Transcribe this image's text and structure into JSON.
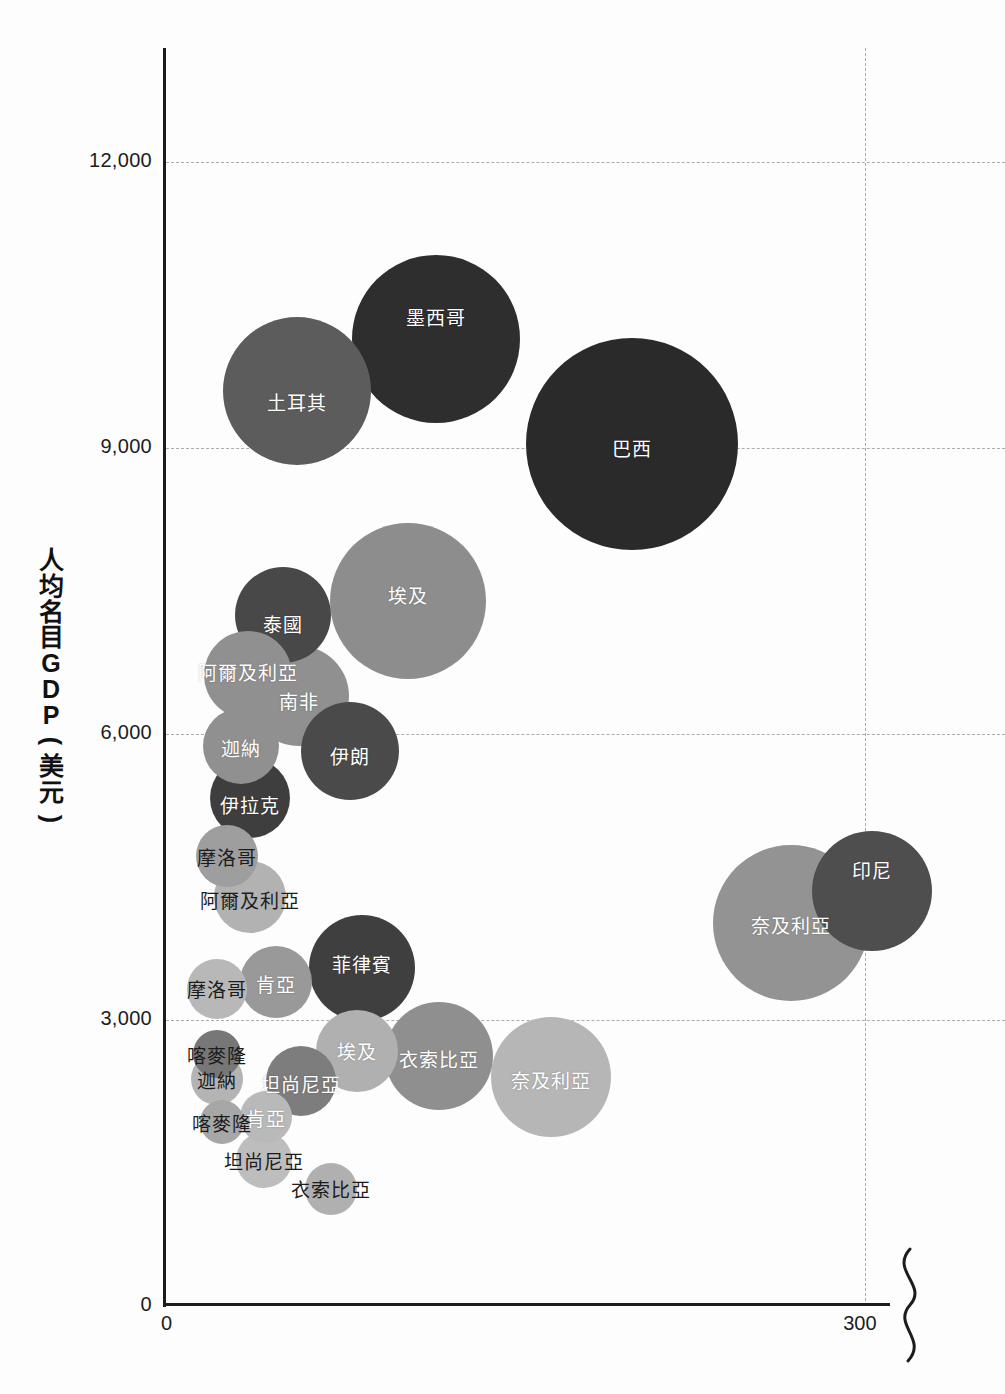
{
  "chart_data": {
    "type": "scatter",
    "title": "",
    "xlabel": "",
    "ylabel": "人均名目GDP (美元)",
    "ylabel_chars": [
      "人",
      "均",
      "名",
      "目",
      "G",
      "D",
      "P",
      "(",
      "美",
      "元",
      ")"
    ],
    "grid": true,
    "legend": "none",
    "axis_break_right": true,
    "xlim": [
      0,
      360
    ],
    "ylim": [
      0,
      13200
    ],
    "x_ticks": [
      "0",
      "300"
    ],
    "x_tick_values": [
      0,
      300
    ],
    "y_ticks": [
      "0",
      "3,000",
      "6,000",
      "9,000",
      "12,000"
    ],
    "y_tick_values": [
      0,
      3000,
      6000,
      9000,
      12000
    ],
    "points": [
      {
        "label": "土耳其",
        "x": 56,
        "y": 9600,
        "r": 74,
        "color": "#5c5c5c",
        "label_dy": 10,
        "label_color": "light"
      },
      {
        "label": "墨西哥",
        "x": 116,
        "y": 10150,
        "r": 84,
        "color": "#2e2e2e",
        "label_dy": -22,
        "label_color": "light"
      },
      {
        "label": "巴西",
        "x": 200,
        "y": 9050,
        "r": 106,
        "color": "#2a2a2a",
        "label_dy": 4,
        "label_color": "light"
      },
      {
        "label": "泰國",
        "x": 50,
        "y": 7250,
        "r": 48,
        "color": "#484848",
        "label_dy": 8,
        "label_color": "light"
      },
      {
        "label": "埃及",
        "x": 104,
        "y": 7400,
        "r": 78,
        "color": "#8d8d8d",
        "label_dy": -6,
        "label_color": "light"
      },
      {
        "label": "阿爾及利亞",
        "x": 35,
        "y": 6620,
        "r": 44,
        "color": "#909090",
        "label_dy": -4,
        "label_color": "light"
      },
      {
        "label": "南非",
        "x": 57,
        "y": 6400,
        "r": 50,
        "color": "#909090",
        "label_dy": 4,
        "label_color": "light"
      },
      {
        "label": "迦納",
        "x": 32,
        "y": 5880,
        "r": 38,
        "color": "#909090",
        "label_dy": 2,
        "label_color": "light"
      },
      {
        "label": "伊朗",
        "x": 79,
        "y": 5820,
        "r": 49,
        "color": "#4a4a4a",
        "label_dy": 4,
        "label_color": "light"
      },
      {
        "label": "伊拉克",
        "x": 36,
        "y": 5330,
        "r": 40,
        "color": "#3e3e3e",
        "label_dy": 6,
        "label_color": "light"
      },
      {
        "label": "摩洛哥",
        "x": 26,
        "y": 4720,
        "r": 31,
        "color": "#9e9e9e",
        "label_dy": 0,
        "label_color": "dark"
      },
      {
        "label": "阿爾及利亞",
        "x": 36,
        "y": 4290,
        "r": 36,
        "color": "#b2b2b2",
        "label_dy": 2,
        "label_color": "dark"
      },
      {
        "label": "摩洛哥",
        "x": 22,
        "y": 3330,
        "r": 30,
        "color": "#b8b8b8",
        "label_dy": 0,
        "label_color": "dark"
      },
      {
        "label": "肯亞",
        "x": 47,
        "y": 3400,
        "r": 36,
        "color": "#999999",
        "label_dy": 2,
        "label_color": "light"
      },
      {
        "label": "菲律賓",
        "x": 84,
        "y": 3550,
        "r": 53,
        "color": "#3f3f3f",
        "label_dy": -4,
        "label_color": "light"
      },
      {
        "label": "埃及",
        "x": 82,
        "y": 2680,
        "r": 41,
        "color": "#b0b0b0",
        "label_dy": 0,
        "label_color": "light"
      },
      {
        "label": "衣索比亞",
        "x": 117,
        "y": 2620,
        "r": 54,
        "color": "#8f8f8f",
        "label_dy": 2,
        "label_color": "light"
      },
      {
        "label": "奈及利亞",
        "x": 165,
        "y": 2400,
        "r": 60,
        "color": "#b6b6b6",
        "label_dy": 2,
        "label_color": "light"
      },
      {
        "label": "喀麥隆",
        "x": 22,
        "y": 2640,
        "r": 24,
        "color": "#777777",
        "label_dy": 0,
        "label_color": "dark"
      },
      {
        "label": "迦納",
        "x": 22,
        "y": 2380,
        "r": 26,
        "color": "#b4b4b4",
        "label_dy": 0,
        "label_color": "dark"
      },
      {
        "label": "坦尚尼亞",
        "x": 58,
        "y": 2360,
        "r": 35,
        "color": "#7d7d7d",
        "label_dy": 2,
        "label_color": "light"
      },
      {
        "label": "喀麥隆",
        "x": 24,
        "y": 1930,
        "r": 22,
        "color": "#a7a7a7",
        "label_dy": 0,
        "label_color": "dark"
      },
      {
        "label": "肯亞",
        "x": 43,
        "y": 1980,
        "r": 26,
        "color": "#b9b9b9",
        "label_dy": 0,
        "label_color": "light"
      },
      {
        "label": "坦尚尼亞",
        "x": 42,
        "y": 1530,
        "r": 28,
        "color": "#bdbdbd",
        "label_dy": 0,
        "label_color": "dark"
      },
      {
        "label": "衣索比亞",
        "x": 71,
        "y": 1230,
        "r": 26,
        "color": "#b0b0b0",
        "label_dy": 0,
        "label_color": "dark"
      },
      {
        "label": "奈及利亞",
        "x": 268,
        "y": 4020,
        "r": 78,
        "color": "#939393",
        "label_dy": 2,
        "label_color": "light"
      },
      {
        "label": "印尼",
        "x": 303,
        "y": 4350,
        "r": 60,
        "color": "#4e4e4e",
        "label_dy": -22,
        "label_color": "light"
      }
    ]
  },
  "axis": {
    "y_title": "人均名目GDP (美元)",
    "x_origin_label": "0",
    "x_300_label": "300",
    "y_zero_label": "0",
    "break_symbol": "axis-break-squiggle"
  },
  "colors": {
    "axis": "#1c1c1c",
    "gridline": "#9aa0a6",
    "background": "#fdfdfd",
    "label_light": "#ffffff",
    "label_dark": "#1c1c1c"
  }
}
